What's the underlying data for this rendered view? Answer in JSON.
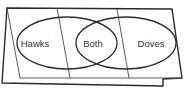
{
  "diagram": {
    "type": "venn",
    "sets": [
      {
        "label": "Hawks"
      },
      {
        "label": "Doves"
      }
    ],
    "intersection_label": "Both",
    "labels": {
      "left": "Hawks",
      "center": "Both",
      "right": "Doves"
    },
    "colors": {
      "line": "#2b2b2b",
      "text": "#333333",
      "background": "#ffffff"
    }
  }
}
